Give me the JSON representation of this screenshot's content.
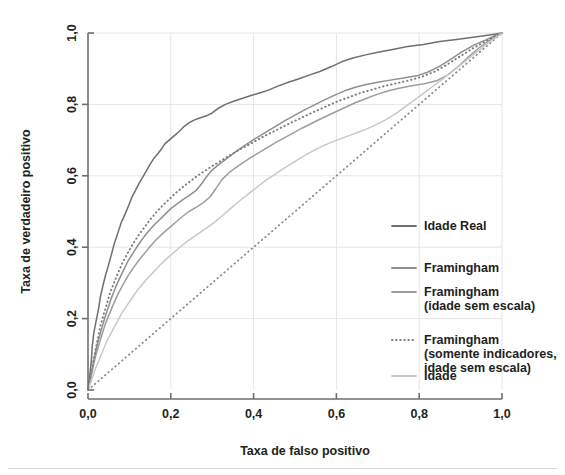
{
  "chart_data": {
    "type": "line",
    "title": "",
    "xlabel": "Taxa de falso positivo",
    "ylabel": "Taxa de verdadeiro positivo",
    "xlim": [
      0,
      1
    ],
    "ylim": [
      0,
      1
    ],
    "xticks": [
      "0,0",
      "0,2",
      "0,4",
      "0,6",
      "0,8",
      "1,0"
    ],
    "xtick_values": [
      0,
      0.2,
      0.4,
      0.6,
      0.8,
      1.0
    ],
    "yticks": [
      "0,0",
      "0,2",
      "0,4",
      "0,6",
      "0,8",
      "1,0"
    ],
    "ytick_values": [
      0,
      0.2,
      0.4,
      0.6,
      0.8,
      1.0
    ],
    "grid": true,
    "legend_position": "right",
    "reference_line": {
      "name": "diagonal-reference",
      "style": "dotted",
      "color": "#8a8a8a",
      "from": [
        0,
        0
      ],
      "to": [
        1,
        1
      ]
    },
    "series": [
      {
        "name": "Idade Real",
        "color": "#6f6f6f",
        "style": "solid",
        "points": [
          [
            0.0,
            0.0
          ],
          [
            0.004,
            0.04
          ],
          [
            0.008,
            0.08
          ],
          [
            0.01,
            0.12
          ],
          [
            0.014,
            0.16
          ],
          [
            0.02,
            0.196
          ],
          [
            0.026,
            0.23
          ],
          [
            0.03,
            0.262
          ],
          [
            0.036,
            0.292
          ],
          [
            0.042,
            0.32
          ],
          [
            0.05,
            0.352
          ],
          [
            0.058,
            0.386
          ],
          [
            0.064,
            0.412
          ],
          [
            0.072,
            0.44
          ],
          [
            0.08,
            0.468
          ],
          [
            0.09,
            0.494
          ],
          [
            0.098,
            0.516
          ],
          [
            0.106,
            0.54
          ],
          [
            0.116,
            0.562
          ],
          [
            0.124,
            0.58
          ],
          [
            0.134,
            0.6
          ],
          [
            0.144,
            0.62
          ],
          [
            0.152,
            0.636
          ],
          [
            0.16,
            0.65
          ],
          [
            0.17,
            0.664
          ],
          [
            0.178,
            0.676
          ],
          [
            0.186,
            0.69
          ],
          [
            0.196,
            0.7
          ],
          [
            0.208,
            0.712
          ],
          [
            0.22,
            0.724
          ],
          [
            0.232,
            0.738
          ],
          [
            0.244,
            0.748
          ],
          [
            0.256,
            0.756
          ],
          [
            0.27,
            0.762
          ],
          [
            0.286,
            0.768
          ],
          [
            0.3,
            0.776
          ],
          [
            0.316,
            0.79
          ],
          [
            0.332,
            0.8
          ],
          [
            0.35,
            0.808
          ],
          [
            0.37,
            0.816
          ],
          [
            0.392,
            0.824
          ],
          [
            0.414,
            0.832
          ],
          [
            0.436,
            0.84
          ],
          [
            0.46,
            0.852
          ],
          [
            0.484,
            0.862
          ],
          [
            0.51,
            0.872
          ],
          [
            0.534,
            0.882
          ],
          [
            0.56,
            0.892
          ],
          [
            0.588,
            0.906
          ],
          [
            0.614,
            0.92
          ],
          [
            0.64,
            0.93
          ],
          [
            0.668,
            0.938
          ],
          [
            0.7,
            0.946
          ],
          [
            0.736,
            0.954
          ],
          [
            0.772,
            0.962
          ],
          [
            0.81,
            0.968
          ],
          [
            0.85,
            0.976
          ],
          [
            0.89,
            0.982
          ],
          [
            0.93,
            0.988
          ],
          [
            0.966,
            0.994
          ],
          [
            1.0,
            1.0
          ]
        ]
      },
      {
        "name": "Framingham",
        "color": "#8f8f8f",
        "style": "solid",
        "points": [
          [
            0.0,
            0.0
          ],
          [
            0.006,
            0.034
          ],
          [
            0.012,
            0.07
          ],
          [
            0.018,
            0.104
          ],
          [
            0.024,
            0.136
          ],
          [
            0.032,
            0.168
          ],
          [
            0.04,
            0.2
          ],
          [
            0.048,
            0.228
          ],
          [
            0.056,
            0.256
          ],
          [
            0.066,
            0.286
          ],
          [
            0.076,
            0.312
          ],
          [
            0.086,
            0.336
          ],
          [
            0.096,
            0.36
          ],
          [
            0.108,
            0.382
          ],
          [
            0.12,
            0.404
          ],
          [
            0.132,
            0.424
          ],
          [
            0.144,
            0.442
          ],
          [
            0.158,
            0.46
          ],
          [
            0.172,
            0.476
          ],
          [
            0.186,
            0.492
          ],
          [
            0.2,
            0.508
          ],
          [
            0.216,
            0.522
          ],
          [
            0.23,
            0.534
          ],
          [
            0.246,
            0.546
          ],
          [
            0.262,
            0.56
          ],
          [
            0.276,
            0.58
          ],
          [
            0.288,
            0.6
          ],
          [
            0.3,
            0.616
          ],
          [
            0.314,
            0.63
          ],
          [
            0.33,
            0.644
          ],
          [
            0.346,
            0.658
          ],
          [
            0.362,
            0.672
          ],
          [
            0.38,
            0.686
          ],
          [
            0.398,
            0.7
          ],
          [
            0.418,
            0.714
          ],
          [
            0.438,
            0.728
          ],
          [
            0.458,
            0.742
          ],
          [
            0.478,
            0.756
          ],
          [
            0.5,
            0.77
          ],
          [
            0.522,
            0.784
          ],
          [
            0.546,
            0.798
          ],
          [
            0.57,
            0.812
          ],
          [
            0.596,
            0.826
          ],
          [
            0.62,
            0.838
          ],
          [
            0.646,
            0.848
          ],
          [
            0.672,
            0.856
          ],
          [
            0.7,
            0.862
          ],
          [
            0.73,
            0.868
          ],
          [
            0.762,
            0.874
          ],
          [
            0.794,
            0.88
          ],
          [
            0.82,
            0.89
          ],
          [
            0.848,
            0.906
          ],
          [
            0.876,
            0.926
          ],
          [
            0.904,
            0.948
          ],
          [
            0.932,
            0.966
          ],
          [
            0.96,
            0.98
          ],
          [
            0.982,
            0.992
          ],
          [
            1.0,
            1.0
          ]
        ]
      },
      {
        "name": "Framingham (idade sem escala)",
        "color": "#9d9d9d",
        "style": "solid",
        "points": [
          [
            0.0,
            0.0
          ],
          [
            0.006,
            0.03
          ],
          [
            0.012,
            0.062
          ],
          [
            0.018,
            0.094
          ],
          [
            0.026,
            0.126
          ],
          [
            0.034,
            0.156
          ],
          [
            0.042,
            0.186
          ],
          [
            0.052,
            0.214
          ],
          [
            0.062,
            0.242
          ],
          [
            0.072,
            0.268
          ],
          [
            0.084,
            0.294
          ],
          [
            0.096,
            0.318
          ],
          [
            0.108,
            0.34
          ],
          [
            0.122,
            0.362
          ],
          [
            0.136,
            0.382
          ],
          [
            0.15,
            0.402
          ],
          [
            0.164,
            0.42
          ],
          [
            0.18,
            0.438
          ],
          [
            0.196,
            0.454
          ],
          [
            0.212,
            0.47
          ],
          [
            0.228,
            0.486
          ],
          [
            0.244,
            0.5
          ],
          [
            0.262,
            0.512
          ],
          [
            0.278,
            0.524
          ],
          [
            0.294,
            0.54
          ],
          [
            0.31,
            0.566
          ],
          [
            0.324,
            0.59
          ],
          [
            0.34,
            0.608
          ],
          [
            0.356,
            0.622
          ],
          [
            0.374,
            0.636
          ],
          [
            0.392,
            0.65
          ],
          [
            0.412,
            0.664
          ],
          [
            0.432,
            0.678
          ],
          [
            0.452,
            0.692
          ],
          [
            0.474,
            0.706
          ],
          [
            0.496,
            0.72
          ],
          [
            0.518,
            0.734
          ],
          [
            0.542,
            0.748
          ],
          [
            0.566,
            0.762
          ],
          [
            0.592,
            0.776
          ],
          [
            0.618,
            0.79
          ],
          [
            0.644,
            0.804
          ],
          [
            0.67,
            0.816
          ],
          [
            0.698,
            0.828
          ],
          [
            0.726,
            0.838
          ],
          [
            0.754,
            0.846
          ],
          [
            0.782,
            0.852
          ],
          [
            0.812,
            0.858
          ],
          [
            0.842,
            0.866
          ],
          [
            0.868,
            0.882
          ],
          [
            0.894,
            0.906
          ],
          [
            0.92,
            0.934
          ],
          [
            0.944,
            0.958
          ],
          [
            0.968,
            0.978
          ],
          [
            0.986,
            0.992
          ],
          [
            1.0,
            1.0
          ]
        ]
      },
      {
        "name": "Framingham (somente indicadores, idade sem escala)",
        "color": "#7d7d7d",
        "style": "dotted",
        "points": [
          [
            0.0,
            0.0
          ],
          [
            0.006,
            0.038
          ],
          [
            0.012,
            0.076
          ],
          [
            0.018,
            0.112
          ],
          [
            0.024,
            0.146
          ],
          [
            0.03,
            0.18
          ],
          [
            0.038,
            0.212
          ],
          [
            0.046,
            0.244
          ],
          [
            0.054,
            0.274
          ],
          [
            0.064,
            0.304
          ],
          [
            0.074,
            0.332
          ],
          [
            0.084,
            0.358
          ],
          [
            0.096,
            0.384
          ],
          [
            0.108,
            0.408
          ],
          [
            0.12,
            0.43
          ],
          [
            0.134,
            0.452
          ],
          [
            0.148,
            0.474
          ],
          [
            0.162,
            0.494
          ],
          [
            0.178,
            0.514
          ],
          [
            0.194,
            0.532
          ],
          [
            0.21,
            0.55
          ],
          [
            0.226,
            0.566
          ],
          [
            0.244,
            0.582
          ],
          [
            0.262,
            0.598
          ],
          [
            0.28,
            0.612
          ],
          [
            0.298,
            0.626
          ],
          [
            0.318,
            0.64
          ],
          [
            0.338,
            0.654
          ],
          [
            0.358,
            0.668
          ],
          [
            0.38,
            0.682
          ],
          [
            0.402,
            0.696
          ],
          [
            0.424,
            0.71
          ],
          [
            0.448,
            0.724
          ],
          [
            0.472,
            0.738
          ],
          [
            0.496,
            0.752
          ],
          [
            0.522,
            0.766
          ],
          [
            0.548,
            0.78
          ],
          [
            0.574,
            0.794
          ],
          [
            0.602,
            0.808
          ],
          [
            0.63,
            0.82
          ],
          [
            0.658,
            0.832
          ],
          [
            0.688,
            0.842
          ],
          [
            0.718,
            0.852
          ],
          [
            0.748,
            0.86
          ],
          [
            0.778,
            0.868
          ],
          [
            0.808,
            0.878
          ],
          [
            0.838,
            0.892
          ],
          [
            0.868,
            0.912
          ],
          [
            0.898,
            0.934
          ],
          [
            0.928,
            0.956
          ],
          [
            0.956,
            0.974
          ],
          [
            0.98,
            0.99
          ],
          [
            1.0,
            1.0
          ]
        ]
      },
      {
        "name": "Idade",
        "color": "#c8c8c8",
        "style": "solid",
        "points": [
          [
            0.0,
            0.0
          ],
          [
            0.008,
            0.026
          ],
          [
            0.016,
            0.054
          ],
          [
            0.026,
            0.082
          ],
          [
            0.036,
            0.11
          ],
          [
            0.046,
            0.138
          ],
          [
            0.058,
            0.164
          ],
          [
            0.07,
            0.19
          ],
          [
            0.082,
            0.216
          ],
          [
            0.096,
            0.24
          ],
          [
            0.11,
            0.264
          ],
          [
            0.124,
            0.286
          ],
          [
            0.14,
            0.308
          ],
          [
            0.156,
            0.328
          ],
          [
            0.172,
            0.348
          ],
          [
            0.19,
            0.368
          ],
          [
            0.208,
            0.386
          ],
          [
            0.226,
            0.404
          ],
          [
            0.244,
            0.42
          ],
          [
            0.264,
            0.436
          ],
          [
            0.284,
            0.452
          ],
          [
            0.304,
            0.468
          ],
          [
            0.324,
            0.488
          ],
          [
            0.344,
            0.508
          ],
          [
            0.364,
            0.528
          ],
          [
            0.386,
            0.548
          ],
          [
            0.408,
            0.568
          ],
          [
            0.43,
            0.588
          ],
          [
            0.454,
            0.606
          ],
          [
            0.478,
            0.624
          ],
          [
            0.502,
            0.642
          ],
          [
            0.528,
            0.66
          ],
          [
            0.554,
            0.676
          ],
          [
            0.58,
            0.69
          ],
          [
            0.606,
            0.702
          ],
          [
            0.634,
            0.714
          ],
          [
            0.662,
            0.726
          ],
          [
            0.69,
            0.74
          ],
          [
            0.718,
            0.756
          ],
          [
            0.746,
            0.776
          ],
          [
            0.774,
            0.8
          ],
          [
            0.802,
            0.824
          ],
          [
            0.83,
            0.848
          ],
          [
            0.858,
            0.872
          ],
          [
            0.884,
            0.896
          ],
          [
            0.91,
            0.92
          ],
          [
            0.936,
            0.944
          ],
          [
            0.96,
            0.966
          ],
          [
            0.982,
            0.984
          ],
          [
            1.0,
            1.0
          ]
        ]
      }
    ],
    "legend": [
      {
        "label": "Idade Real",
        "color": "#6f6f6f",
        "style": "solid",
        "lines": [
          "Idade Real"
        ]
      },
      {
        "label": "Framingham",
        "color": "#8f8f8f",
        "style": "solid",
        "lines": [
          "Framingham"
        ]
      },
      {
        "label": "Framingham (idade sem escala)",
        "color": "#9d9d9d",
        "style": "solid",
        "lines": [
          "Framingham",
          "(idade sem escala)"
        ]
      },
      {
        "label": "Framingham (somente indicadores, idade sem escala)",
        "color": "#7d7d7d",
        "style": "dotted",
        "lines": [
          "Framingham",
          "(somente indicadores,",
          "idade sem escala)"
        ]
      },
      {
        "label": "Idade",
        "color": "#c8c8c8",
        "style": "solid",
        "lines": [
          "Idade"
        ]
      }
    ]
  },
  "colors": {
    "axis": "#6e6e6e",
    "grid": "#e6e6e6",
    "text": "#231f20",
    "background": "#ffffff",
    "rule": "#d9d9d9"
  }
}
